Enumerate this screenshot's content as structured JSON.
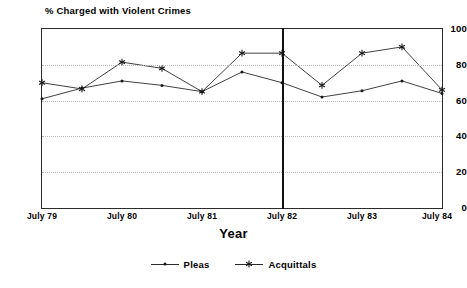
{
  "chart_data": {
    "type": "line",
    "title": "% Charged with Violent Crimes",
    "xlabel": "Year",
    "ylabel": "",
    "ylim": [
      0,
      100
    ],
    "yticks": [
      0,
      20,
      40,
      60,
      80,
      100
    ],
    "grid": true,
    "legend_position": "bottom",
    "x": [
      "July 79",
      "Jan 80",
      "July 80",
      "Jan 81",
      "July 81",
      "Jan 82",
      "July 82",
      "Jan 83",
      "July 83",
      "Jan 84",
      "July 84"
    ],
    "xtick_labels": [
      "July 79",
      "July 80",
      "July 81",
      "July 82",
      "July 83",
      "July 84"
    ],
    "annotations": [
      {
        "type": "vertical-line",
        "x": "July 82",
        "label": "July 82 divider"
      }
    ],
    "series": [
      {
        "name": "Pleas",
        "marker": "dot",
        "values": [
          61,
          67,
          71,
          68.5,
          65,
          76,
          70,
          62,
          65.5,
          71,
          64
        ]
      },
      {
        "name": "Acquittals",
        "marker": "star",
        "values": [
          70,
          66.5,
          81.5,
          78,
          65,
          86.5,
          86.5,
          68.5,
          86.5,
          90,
          66
        ]
      }
    ]
  },
  "legend": {
    "items": [
      {
        "label": "Pleas",
        "marker": "dot"
      },
      {
        "label": "Acquittals",
        "marker": "star"
      }
    ]
  }
}
